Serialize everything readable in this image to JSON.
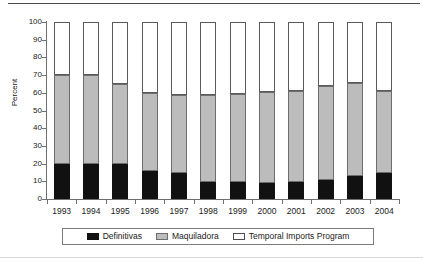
{
  "chart_data": {
    "type": "bar",
    "stacked": true,
    "title": "",
    "xlabel": "",
    "ylabel": "Percent",
    "ylim": [
      0,
      100
    ],
    "ytick_step": 10,
    "yticks": [
      0,
      10,
      20,
      30,
      40,
      50,
      60,
      70,
      80,
      90,
      100
    ],
    "grid": false,
    "legend_position": "bottom",
    "categories": [
      "1993",
      "1994",
      "1995",
      "1996",
      "1997",
      "1998",
      "1999",
      "2000",
      "2001",
      "2002",
      "2003",
      "2004"
    ],
    "series": [
      {
        "name": "Definitivas",
        "color": "#111111",
        "values": [
          20.0,
          20.0,
          19.5,
          16.0,
          14.5,
          9.5,
          9.5,
          9.0,
          9.5,
          10.5,
          13.0,
          14.5
        ]
      },
      {
        "name": "Maquiladora",
        "color": "#bcbcbc",
        "values": [
          50.0,
          49.8,
          45.3,
          44.0,
          44.0,
          49.0,
          50.0,
          51.3,
          51.3,
          53.4,
          52.5,
          46.4
        ]
      },
      {
        "name": "Temporal Imports Program",
        "color": "#ffffff",
        "values": [
          30.0,
          30.2,
          35.2,
          40.0,
          41.5,
          41.5,
          40.5,
          39.7,
          39.2,
          36.1,
          34.5,
          39.1
        ]
      }
    ],
    "cumulative_tops": {
      "definitivas": [
        20.0,
        20.0,
        19.5,
        16.0,
        14.5,
        9.5,
        9.5,
        9.0,
        9.5,
        10.5,
        13.0,
        14.5
      ],
      "maquiladora": [
        70.0,
        69.8,
        64.8,
        60.0,
        58.5,
        58.5,
        59.5,
        60.3,
        60.8,
        63.9,
        65.5,
        60.9
      ],
      "temporal": [
        100.0,
        100.0,
        100.0,
        100.0,
        100.0,
        100.0,
        100.0,
        100.0,
        100.0,
        100.0,
        100.0,
        100.0
      ]
    }
  },
  "axis": {
    "y_title": "Percent",
    "y_labels": [
      "100",
      "90",
      "80",
      "70",
      "60",
      "50",
      "40",
      "30",
      "20",
      "10",
      "0"
    ],
    "x_labels": [
      "1993",
      "1994",
      "1995",
      "1996",
      "1997",
      "1998",
      "1999",
      "2000",
      "2001",
      "2002",
      "2003",
      "2004"
    ]
  },
  "legend": {
    "items": [
      {
        "label": "Definitivas",
        "swatch": "black-square-icon"
      },
      {
        "label": "Maquiladora",
        "swatch": "gray-square-icon"
      },
      {
        "label": "Temporal Imports Program",
        "swatch": "white-square-icon"
      }
    ]
  }
}
